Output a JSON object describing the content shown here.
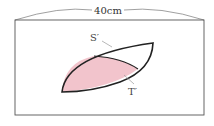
{
  "diagram": {
    "width_label": "40cm",
    "label_s": "S′",
    "label_t": "T′",
    "colors": {
      "fill": "#f2c4cc",
      "outline": "#222222",
      "frame": "#555555",
      "leader": "#999999"
    }
  }
}
